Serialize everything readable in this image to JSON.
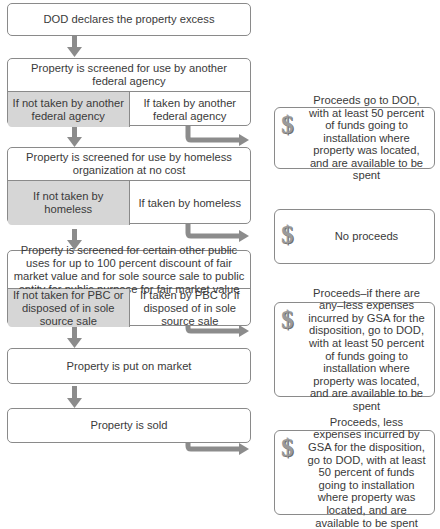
{
  "flow": {
    "step1": "DOD declares the property excess",
    "step2": {
      "title": "Property is screened for use by another federal agency",
      "no": "If not taken by another federal agency",
      "yes": "If taken by another federal agency"
    },
    "step3": {
      "title": "Property is screened for use by homeless organization at no cost",
      "no": "If not taken by homeless",
      "yes": "If taken by homeless"
    },
    "step4": {
      "title": "Property is screened for certain other public uses for up to 100 percent discount of fair market value and for sole source sale to public entity for public purpose for fair market value",
      "no": "If not taken for PBC or disposed of in sole source sale",
      "yes": "If taken by PBC or if disposed of in sole source sale"
    },
    "step5": "Property is put on market",
    "step6": "Property is sold"
  },
  "outcomes": [
    {
      "icon": "dollar-icon",
      "text": "Proceeds go to DOD, with at least 50 percent of funds going to installation where property was located, and are available to be spent"
    },
    {
      "icon": "dollar-icon",
      "text": "No proceeds"
    },
    {
      "icon": "dollar-icon",
      "text": "Proceeds–if there are any–less expenses incurred by GSA for the disposition, go to DOD, with at least 50 percent of funds going to installation where property was located, and are available to be spent"
    },
    {
      "icon": "dollar-icon",
      "text": "Proceeds, less expenses incurred by GSA for the disposition, go to DOD, with at least 50 percent of funds going to installation where property was located, and are available to be spent"
    }
  ],
  "dollar_glyph": "$"
}
